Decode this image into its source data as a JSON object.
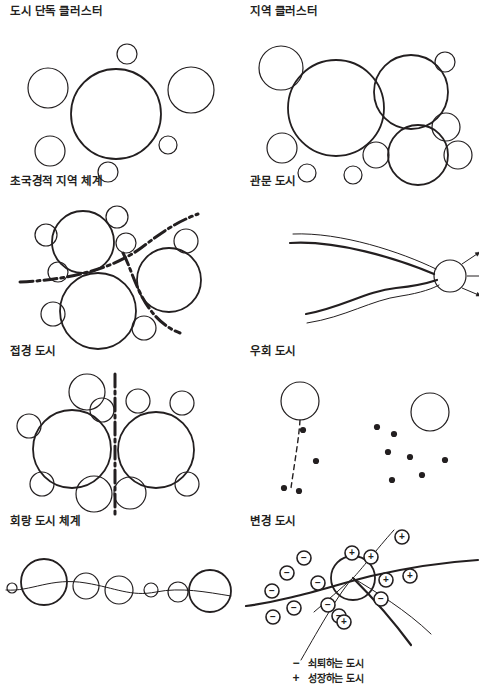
{
  "figure": {
    "kind": "diagram",
    "stroke_color": "#231f20",
    "background_color": "#ffffff",
    "columns": 2,
    "rows": 4
  },
  "panels": [
    {
      "id": "urban-single-cluster",
      "title": "도시 단독 클러스터",
      "row": 1,
      "column": 1,
      "motif": "one dominant circle ringed by smaller satellite circles",
      "circles": [
        {
          "cx": 110,
          "cy": 94,
          "r": 45,
          "role": "primary-city"
        },
        {
          "cx": 42,
          "cy": 68,
          "r": 20,
          "role": "satellite"
        },
        {
          "cx": 185,
          "cy": 70,
          "r": 23,
          "role": "satellite"
        },
        {
          "cx": 44,
          "cy": 131,
          "r": 15,
          "role": "satellite"
        },
        {
          "cx": 121,
          "cy": 34,
          "r": 10,
          "role": "satellite"
        },
        {
          "cx": 162,
          "cy": 125,
          "r": 9,
          "role": "satellite"
        },
        {
          "cx": 102,
          "cy": 152,
          "r": 10,
          "role": "satellite"
        }
      ],
      "lines": [],
      "dots": [],
      "signs": []
    },
    {
      "id": "regional-cluster",
      "title": "지역 클러스터",
      "row": 1,
      "column": 2,
      "motif": "several large circles of differing size packed together with small satellites",
      "circles": [
        {
          "cx": 90,
          "cy": 88,
          "r": 48,
          "role": "primary-city"
        },
        {
          "cx": 165,
          "cy": 72,
          "r": 37,
          "role": "primary-city"
        },
        {
          "cx": 172,
          "cy": 135,
          "r": 30,
          "role": "primary-city"
        },
        {
          "cx": 35,
          "cy": 48,
          "r": 22,
          "role": "satellite"
        },
        {
          "cx": 199,
          "cy": 42,
          "r": 10,
          "role": "satellite"
        },
        {
          "cx": 200,
          "cy": 107,
          "r": 14,
          "role": "satellite"
        },
        {
          "cx": 212,
          "cy": 135,
          "r": 14,
          "role": "satellite"
        },
        {
          "cx": 36,
          "cy": 128,
          "r": 15,
          "role": "satellite"
        },
        {
          "cx": 130,
          "cy": 135,
          "r": 13,
          "role": "satellite"
        },
        {
          "cx": 61,
          "cy": 153,
          "r": 9,
          "role": "satellite"
        },
        {
          "cx": 107,
          "cy": 155,
          "r": 9,
          "role": "satellite"
        }
      ],
      "lines": [],
      "dots": [],
      "signs": []
    },
    {
      "id": "transboundary-regional-system",
      "title": "초국경적 지역 체계",
      "row": 2,
      "column": 1,
      "motif": "clusters divided by dash-dot national border lines",
      "circles": [
        {
          "cx": 77,
          "cy": 52,
          "r": 31,
          "role": "primary-city"
        },
        {
          "cx": 92,
          "cy": 121,
          "r": 38,
          "role": "primary-city"
        },
        {
          "cx": 163,
          "cy": 90,
          "r": 32,
          "role": "primary-city"
        },
        {
          "cx": 40,
          "cy": 45,
          "r": 11,
          "role": "satellite"
        },
        {
          "cx": 111,
          "cy": 27,
          "r": 11,
          "role": "satellite"
        },
        {
          "cx": 120,
          "cy": 53,
          "r": 10,
          "role": "satellite"
        },
        {
          "cx": 52,
          "cy": 82,
          "r": 10,
          "role": "satellite"
        },
        {
          "cx": 180,
          "cy": 51,
          "r": 12,
          "role": "satellite"
        },
        {
          "cx": 47,
          "cy": 124,
          "r": 12,
          "role": "satellite"
        },
        {
          "cx": 138,
          "cy": 138,
          "r": 12,
          "role": "satellite"
        }
      ],
      "lines": [
        {
          "kind": "border-dash-dot",
          "path": "M 14 92 C 60 90 105 80 135 58 C 155 43 170 32 192 24"
        },
        {
          "kind": "border-dash-dot",
          "path": "M 117 63 C 125 78 130 100 143 118 C 152 131 163 139 174 143"
        }
      ],
      "dots": [],
      "signs": []
    },
    {
      "id": "gateway-city",
      "title": "관문 도시",
      "row": 2,
      "column": 2,
      "motif": "corridors converging on a single gateway node with outward arrows",
      "circles": [
        {
          "cx": 204,
          "cy": 86,
          "r": 16,
          "role": "gateway-node"
        }
      ],
      "lines": [
        {
          "kind": "corridor-thick",
          "path": "M 44 53 C 90 50 150 68 188 84"
        },
        {
          "kind": "corridor-thin",
          "path": "M 47 44 C 95 42 155 62 190 79"
        },
        {
          "kind": "corridor-thick",
          "path": "M 60 124 C 95 118 120 101 150 98 C 170 96 185 92 191 90"
        },
        {
          "kind": "corridor-thin",
          "path": "M 61 133 C 100 127 125 110 155 106 C 175 103 188 98 193 95"
        }
      ],
      "arrows": [
        {
          "x1": 216,
          "y1": 74,
          "x2": 234,
          "y2": 62
        },
        {
          "x1": 221,
          "y1": 86,
          "x2": 241,
          "y2": 86
        },
        {
          "x1": 216,
          "y1": 98,
          "x2": 235,
          "y2": 106
        }
      ],
      "dots": [],
      "signs": []
    },
    {
      "id": "border-city",
      "title": "접경 도시",
      "row": 3,
      "column": 1,
      "motif": "twin cities straddling a vertical dash-dot boundary",
      "circles": [
        {
          "cx": 66,
          "cy": 89,
          "r": 39,
          "role": "primary-city"
        },
        {
          "cx": 150,
          "cy": 90,
          "r": 38,
          "role": "primary-city"
        },
        {
          "cx": 81,
          "cy": 32,
          "r": 18,
          "role": "satellite"
        },
        {
          "cx": 96,
          "cy": 50,
          "r": 12,
          "role": "satellite"
        },
        {
          "cx": 23,
          "cy": 66,
          "r": 12,
          "role": "satellite"
        },
        {
          "cx": 36,
          "cy": 124,
          "r": 12,
          "role": "satellite"
        },
        {
          "cx": 88,
          "cy": 134,
          "r": 18,
          "role": "satellite"
        },
        {
          "cx": 124,
          "cy": 133,
          "r": 16,
          "role": "satellite"
        },
        {
          "cx": 132,
          "cy": 41,
          "r": 12,
          "role": "satellite"
        },
        {
          "cx": 176,
          "cy": 43,
          "r": 12,
          "role": "satellite"
        },
        {
          "cx": 181,
          "cy": 124,
          "r": 12,
          "role": "satellite"
        }
      ],
      "lines": [
        {
          "kind": "border-dash-dot-vertical",
          "path": "M 109 14 L 109 156"
        }
      ],
      "dots": [],
      "signs": []
    },
    {
      "id": "bypassed-city",
      "title": "우회 도시",
      "row": 3,
      "column": 2,
      "motif": "two isolated circles with scattered dots and a broken dashed link",
      "circles": [
        {
          "cx": 54,
          "cy": 41,
          "r": 19,
          "role": "city"
        },
        {
          "cx": 184,
          "cy": 52,
          "r": 19,
          "role": "city"
        }
      ],
      "lines": [
        {
          "kind": "link-dashed",
          "path": "M 54 60 C 53 78 48 106 45 128"
        }
      ],
      "dots": [
        {
          "cx": 57,
          "cy": 70
        },
        {
          "cx": 70,
          "cy": 101
        },
        {
          "cx": 53,
          "cy": 131
        },
        {
          "cx": 38,
          "cy": 128
        },
        {
          "cx": 131,
          "cy": 67
        },
        {
          "cx": 148,
          "cy": 74
        },
        {
          "cx": 142,
          "cy": 92
        },
        {
          "cx": 164,
          "cy": 97
        },
        {
          "cx": 199,
          "cy": 100
        },
        {
          "cx": 176,
          "cy": 115
        },
        {
          "cx": 146,
          "cy": 120
        }
      ],
      "signs": []
    },
    {
      "id": "corridor-city-system",
      "title": "회랑 도시 체계",
      "row": 4,
      "column": 1,
      "motif": "string of graduated circles threaded along a gently waving corridor line",
      "circles": [
        {
          "cx": 6,
          "cy": 58,
          "r": 5,
          "role": "node"
        },
        {
          "cx": 38,
          "cy": 52,
          "r": 23,
          "role": "node-major"
        },
        {
          "cx": 80,
          "cy": 56,
          "r": 13,
          "role": "node"
        },
        {
          "cx": 113,
          "cy": 60,
          "r": 14,
          "role": "node"
        },
        {
          "cx": 145,
          "cy": 60,
          "r": 7,
          "role": "node"
        },
        {
          "cx": 172,
          "cy": 62,
          "r": 10,
          "role": "node"
        },
        {
          "cx": 204,
          "cy": 61,
          "r": 21,
          "role": "node-major"
        }
      ],
      "lines": [
        {
          "kind": "corridor-thin",
          "path": "M 0 60 C 25 62 45 47 80 53 C 110 58 125 67 150 62 C 175 57 200 62 225 66"
        }
      ],
      "dots": [],
      "signs": []
    },
    {
      "id": "frontier-city",
      "title": "변경 도시",
      "row": 4,
      "column": 2,
      "motif": "border crossing node with declining cities on one side and growing cities on the other",
      "circles": [
        {
          "cx": 107,
          "cy": 48,
          "r": 22,
          "role": "border-node"
        }
      ],
      "lines": [
        {
          "kind": "border-thick",
          "path": "M 0 76 C 45 70 85 56 125 46 C 165 37 200 32 232 30"
        },
        {
          "kind": "route-thin",
          "path": "M 148 0 C 130 20 115 40 107 48 C 95 60 75 95 55 130"
        },
        {
          "kind": "route-thin",
          "path": "M 107 48 C 130 62 160 80 185 104"
        },
        {
          "kind": "route-thick",
          "path": "M 107 48 C 125 66 145 88 165 115"
        },
        {
          "kind": "route-thin",
          "path": "M 107 48 C 95 58 80 72 68 82"
        }
      ],
      "signs": [
        {
          "sym": "−",
          "cx": 58,
          "cy": 28,
          "meaning": "declining"
        },
        {
          "sym": "−",
          "cx": 41,
          "cy": 43,
          "meaning": "declining"
        },
        {
          "sym": "−",
          "cx": 72,
          "cy": 53,
          "meaning": "declining"
        },
        {
          "sym": "−",
          "cx": 26,
          "cy": 61,
          "meaning": "declining"
        },
        {
          "sym": "−",
          "cx": 48,
          "cy": 78,
          "meaning": "declining"
        },
        {
          "sym": "−",
          "cx": 82,
          "cy": 75,
          "meaning": "declining"
        },
        {
          "sym": "−",
          "cx": 27,
          "cy": 87,
          "meaning": "declining"
        },
        {
          "sym": "−",
          "cx": 93,
          "cy": 86,
          "meaning": "declining"
        },
        {
          "sym": "−",
          "cx": 135,
          "cy": 69,
          "meaning": "declining"
        },
        {
          "sym": "+",
          "cx": 106,
          "cy": 23,
          "meaning": "growing"
        },
        {
          "sym": "+",
          "cx": 125,
          "cy": 27,
          "meaning": "growing"
        },
        {
          "sym": "+",
          "cx": 156,
          "cy": 7,
          "meaning": "growing"
        },
        {
          "sym": "+",
          "cx": 140,
          "cy": 50,
          "meaning": "growing"
        },
        {
          "sym": "+",
          "cx": 164,
          "cy": 46,
          "meaning": "growing"
        },
        {
          "sym": "+",
          "cx": 98,
          "cy": 92,
          "meaning": "growing"
        }
      ],
      "dots": []
    }
  ],
  "legend": {
    "items": [
      {
        "symbol": "−",
        "label": "쇠퇴하는 도시"
      },
      {
        "symbol": "+",
        "label": "성장하는 도시"
      }
    ]
  }
}
